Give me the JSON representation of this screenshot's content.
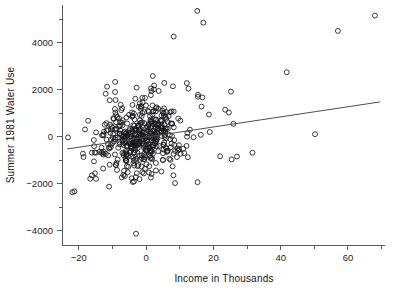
{
  "chart_data": {
    "type": "scatter",
    "title": "",
    "xlabel": "Income in Thousands",
    "ylabel": "Summer 1981 Water Use",
    "xlim": [
      -25,
      71
    ],
    "ylim": [
      -4600,
      5600
    ],
    "xticks_major": [
      -20,
      0,
      20,
      40,
      60
    ],
    "xticks_major_labels": [
      "−20",
      "0",
      "20",
      "40",
      "60"
    ],
    "xticks_minor": [
      -10,
      10,
      30,
      50,
      70
    ],
    "yticks_major": [
      -4000,
      -2000,
      0,
      2000,
      4000
    ],
    "yticks_major_labels": [
      "−4000",
      "−2000",
      "0",
      "2000",
      "4000"
    ],
    "yticks_minor": [
      -3000,
      -1000,
      1000,
      3000,
      5000
    ],
    "grid": false,
    "legend": null,
    "marker": "open-circle",
    "marker_color": "#18181a",
    "n_points": 496,
    "regression_line": {
      "x_start": -23.5,
      "y_start": -520,
      "x_end": 69.5,
      "y_end": 1480,
      "color": "#4a4f54"
    },
    "outliers": [
      [
        15.2,
        5350
      ],
      [
        17.0,
        4850
      ],
      [
        8.2,
        4260
      ],
      [
        57.0,
        4500
      ],
      [
        68.0,
        5150
      ],
      [
        41.8,
        2740
      ],
      [
        50.2,
        110
      ],
      [
        -3.0,
        -4120
      ],
      [
        -21.3,
        -2320
      ],
      [
        -21.9,
        -2360
      ],
      [
        -23.2,
        -30
      ],
      [
        -18.6,
        -860
      ],
      [
        31.6,
        -680
      ],
      [
        25.2,
        1920
      ],
      [
        2.0,
        2580
      ],
      [
        -9.2,
        2330
      ],
      [
        5.4,
        2290
      ],
      [
        12.1,
        2280
      ],
      [
        -11.6,
        2130
      ],
      [
        1.6,
        1940
      ],
      [
        -12.0,
        1830
      ],
      [
        15.4,
        1700
      ],
      [
        -2.8,
        2090
      ],
      [
        23.5,
        1150
      ],
      [
        24.6,
        1030
      ],
      [
        15.3,
        -1930
      ],
      [
        8.1,
        -1640
      ],
      [
        -3.6,
        -1900
      ],
      [
        -11.0,
        -2120
      ],
      [
        -14.9,
        -1790
      ],
      [
        -16.1,
        -1640
      ],
      [
        -15.2,
        -1550
      ],
      [
        25.4,
        -960
      ],
      [
        27.0,
        -840
      ],
      [
        22.0,
        -830
      ],
      [
        12.4,
        -870
      ]
    ],
    "cluster": {
      "description": "Dense central cloud of open circles",
      "x_center": -2.0,
      "x_spread": 8.2,
      "y_center": 30,
      "y_spread": 720,
      "x_range": [
        -20,
        30
      ],
      "y_range": [
        -2200,
        2200
      ],
      "seed": 20250411,
      "count": 460
    }
  },
  "axes": {
    "x_axis_name": "income-axis",
    "y_axis_name": "water-use-axis"
  }
}
